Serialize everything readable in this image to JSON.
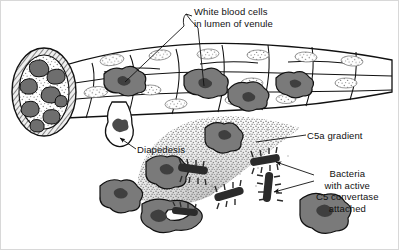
{
  "figure": {
    "background_color": "#ffffff",
    "ink_color": "#111111",
    "cell_fill": "#7a7a7a",
    "nucleus_fill": "#4a4a4a",
    "stipple_color": "#8d8d8d",
    "bacteria_fill": "#2b2b2b",
    "border_color": "#cfcfcf"
  },
  "labels": {
    "white_blood_cells": {
      "line1": "White blood cells",
      "line2": "in lumen of venule",
      "text": "White blood cells\nin lumen of venule"
    },
    "diapedesis": {
      "text": "Diapedesis"
    },
    "c5a_gradient": {
      "text": "C5a gradient"
    },
    "bacteria": {
      "line1": "Bacteria",
      "line2": "with active",
      "line3": "C5 convertase",
      "line4": "attached",
      "text": "Bacteria\nwith active\nC5 convertase\nattached"
    }
  },
  "structures": {
    "venule": "cut-away venule with hatched rim and blood cells in cross-section",
    "endothelium": "endothelial cell mesh with stippled nuclei",
    "wbc_in_wall": "dark multilobed white blood cells adherent to venule wall",
    "diapedesis_cell": "white blood cell squeezing between endothelial cells",
    "gradient_cone": "stippled C5a concentration gradient spreading from bacteria",
    "migrating_wbcs": "white blood cells migrating through tissue toward bacteria",
    "phagocytosis": "white blood cell engulfing a bacterium",
    "bacteria_rods": "rod-shaped bacteria with bristled surface"
  }
}
